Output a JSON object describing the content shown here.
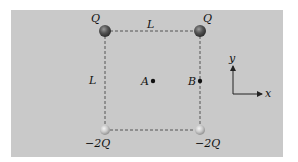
{
  "figure": {
    "type": "square charge configuration",
    "side_label": "L",
    "charges": [
      {
        "position": "top-left",
        "label": "Q",
        "sign": "positive"
      },
      {
        "position": "top-right",
        "label": "Q",
        "sign": "positive"
      },
      {
        "position": "bottom-left",
        "label": "−2Q",
        "sign": "negative"
      },
      {
        "position": "bottom-right",
        "label": "−2Q",
        "sign": "negative"
      }
    ],
    "points": [
      {
        "label": "A",
        "location": "center of square"
      },
      {
        "label": "B",
        "location": "midpoint of right side"
      }
    ],
    "labels": {
      "top_side": "L",
      "left_side": "L",
      "q_top_left": "Q",
      "q_top_right": "Q",
      "q_bottom_left": "−2Q",
      "q_bottom_right": "−2Q",
      "point_a": "A",
      "point_b": "B"
    },
    "axes": {
      "x_label": "x",
      "y_label": "y"
    },
    "colors": {
      "background": "#c9c9c9",
      "lines": "#555555",
      "text": "#111111"
    }
  }
}
